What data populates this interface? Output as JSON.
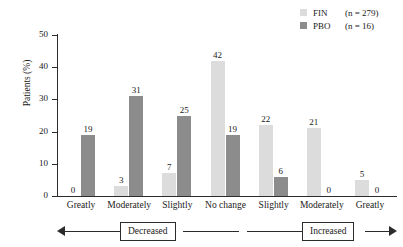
{
  "chart_data": {
    "type": "bar",
    "title": "",
    "xlabel": "",
    "ylabel": "Patients (%)",
    "ylim": [
      0,
      50
    ],
    "yticks": [
      0,
      10,
      20,
      30,
      40,
      50
    ],
    "grid": false,
    "legend_position": "top-right",
    "categories": [
      "Greatly",
      "Moderately",
      "Slightly",
      "No change",
      "Slightly",
      "Moderately",
      "Greatly"
    ],
    "series": [
      {
        "name": "FIN",
        "n_label": "(n = 279)",
        "color": "#dcdcdc",
        "values": [
          0,
          3,
          7,
          42,
          22,
          21,
          5
        ]
      },
      {
        "name": "PBO",
        "n_label": "(n = 16)",
        "color": "#8c8c8c",
        "values": [
          19,
          31,
          25,
          19,
          6,
          0,
          0
        ]
      }
    ],
    "annotations": [
      {
        "label": "Decreased",
        "side": "left"
      },
      {
        "label": "Increased",
        "side": "right"
      }
    ]
  },
  "legend": {
    "rows": [
      {
        "label": "FIN",
        "n": "(n = 279)"
      },
      {
        "label": "PBO",
        "n": "(n = 16)"
      }
    ]
  },
  "axis": {
    "y_label": "Patients (%)",
    "y_ticks": [
      "50",
      "40",
      "30",
      "20",
      "10",
      "0"
    ]
  },
  "direction": {
    "decreased": "Decreased",
    "increased": "Increased"
  }
}
